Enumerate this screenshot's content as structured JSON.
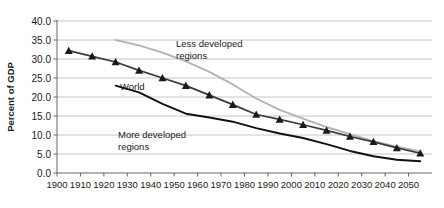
{
  "chart_data": {
    "type": "line",
    "title": "",
    "xlabel": "",
    "ylabel": "Percent of GDP",
    "xlim": [
      1900,
      2060
    ],
    "ylim": [
      0.0,
      40.0
    ],
    "grid": true,
    "legend": "inline-annotations",
    "ytick_labels": [
      "0.0",
      "5.0",
      "10.0",
      "15.0",
      "20.0",
      "25.0",
      "30.0",
      "35.0",
      "40.0"
    ],
    "ytick_values": [
      0.0,
      5.0,
      10.0,
      15.0,
      20.0,
      25.0,
      30.0,
      35.0,
      40.0
    ],
    "xtick_labels": [
      "1900",
      "1910",
      "1920",
      "1930",
      "1940",
      "1950",
      "1960",
      "1970",
      "1980",
      "1990",
      "2000",
      "2010",
      "2020",
      "2030",
      "2040",
      "2050"
    ],
    "xtick_values": [
      1900,
      1910,
      1920,
      1930,
      1940,
      1950,
      1960,
      1970,
      1980,
      1990,
      2000,
      2010,
      2020,
      2030,
      2040,
      2050
    ],
    "series": [
      {
        "name": "Less developed regions",
        "color": "#b3b3b3",
        "marker": "none",
        "x": [
          1925,
          1935,
          1945,
          1955,
          1965,
          1975,
          1985,
          1995,
          2005,
          2015,
          2025,
          2035,
          2045,
          2055
        ],
        "values": [
          35.0,
          33.6,
          31.7,
          29.4,
          26.6,
          23.3,
          19.6,
          16.6,
          14.3,
          12.1,
          10.2,
          8.4,
          6.9,
          5.7
        ]
      },
      {
        "name": "World",
        "color": "#3b3b3b",
        "marker": "triangle",
        "x": [
          1905,
          1915,
          1925,
          1935,
          1945,
          1955,
          1965,
          1975,
          1985,
          1995,
          2005,
          2015,
          2025,
          2035,
          2045,
          2055
        ],
        "values": [
          32.2,
          30.7,
          29.2,
          27.0,
          25.0,
          23.0,
          20.5,
          18.0,
          15.4,
          14.1,
          12.7,
          11.2,
          9.6,
          8.2,
          6.6,
          5.2
        ]
      },
      {
        "name": "More developed regions",
        "color": "#111111",
        "marker": "none",
        "x": [
          1925,
          1935,
          1945,
          1955,
          1965,
          1975,
          1985,
          1995,
          2005,
          2015,
          2025,
          2035,
          2045,
          2055
        ],
        "values": [
          23.0,
          21.2,
          18.2,
          15.6,
          14.6,
          13.5,
          11.8,
          10.4,
          9.2,
          7.6,
          5.8,
          4.4,
          3.5,
          3.1
        ]
      }
    ],
    "annotations": [
      {
        "id": "less-developed",
        "text_line1": "Less developed",
        "text_line2": "regions",
        "x": 176,
        "y": 47
      },
      {
        "id": "world",
        "text_line1": "World",
        "text_line2": "",
        "x": 120,
        "y": 90
      },
      {
        "id": "more-developed",
        "text_line1": "More developed",
        "text_line2": "regions",
        "x": 118,
        "y": 138
      }
    ]
  }
}
